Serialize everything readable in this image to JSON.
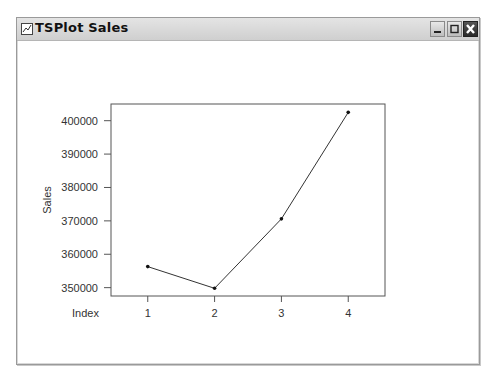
{
  "window": {
    "title": "TSPlot Sales",
    "controls": {
      "minimize": "minimize",
      "maximize": "maximize",
      "close": "close"
    }
  },
  "chart_data": {
    "type": "line",
    "title": "",
    "xlabel": "Index",
    "ylabel": "Sales",
    "categories": [
      "1",
      "2",
      "3",
      "4"
    ],
    "x": [
      1,
      2,
      3,
      4
    ],
    "values": [
      356300,
      349800,
      370600,
      402500
    ],
    "series": [
      {
        "name": "Sales",
        "values": [
          356300,
          349800,
          370600,
          402500
        ]
      }
    ],
    "yticks": [
      350000,
      360000,
      370000,
      380000,
      390000,
      400000
    ],
    "ytick_labels": [
      "350000",
      "360000",
      "370000",
      "380000",
      "390000",
      "400000"
    ],
    "xtick_labels": [
      "1",
      "2",
      "3",
      "4"
    ],
    "ylim": [
      347500,
      405000
    ],
    "xlim": [
      0.45,
      4.55
    ],
    "grid": false,
    "legend": "none",
    "markers": true,
    "line_color": "#333333"
  }
}
